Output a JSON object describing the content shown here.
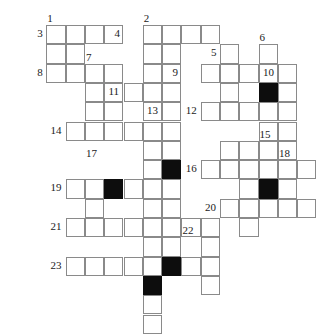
{
  "puzzle": {
    "type": "crossword-grid",
    "title": "Crossword puzzle grid",
    "columns": 15,
    "rows": 14,
    "cell_size": 19.3,
    "origin_x": 27,
    "origin_y": 25,
    "colors": {
      "grid_line": "#8a8a8a",
      "cell_fill": "#ffffff",
      "block_fill": "#0d0d0d",
      "number_text": "#1a1a1a",
      "page_background": "#ffffff"
    },
    "cells": [
      {
        "c": 1,
        "r": 0
      },
      {
        "c": 2,
        "r": 0
      },
      {
        "c": 3,
        "r": 0
      },
      {
        "c": 4,
        "r": 0
      },
      {
        "c": 6,
        "r": 0
      },
      {
        "c": 7,
        "r": 0
      },
      {
        "c": 8,
        "r": 0
      },
      {
        "c": 9,
        "r": 0
      },
      {
        "c": 1,
        "r": 1
      },
      {
        "c": 2,
        "r": 1
      },
      {
        "c": 6,
        "r": 1
      },
      {
        "c": 7,
        "r": 1
      },
      {
        "c": 10,
        "r": 1
      },
      {
        "c": 12,
        "r": 1
      },
      {
        "c": 1,
        "r": 2
      },
      {
        "c": 2,
        "r": 2
      },
      {
        "c": 3,
        "r": 2
      },
      {
        "c": 4,
        "r": 2
      },
      {
        "c": 6,
        "r": 2
      },
      {
        "c": 7,
        "r": 2
      },
      {
        "c": 9,
        "r": 2
      },
      {
        "c": 10,
        "r": 2
      },
      {
        "c": 11,
        "r": 2
      },
      {
        "c": 12,
        "r": 2
      },
      {
        "c": 13,
        "r": 2
      },
      {
        "c": 3,
        "r": 3
      },
      {
        "c": 4,
        "r": 3
      },
      {
        "c": 5,
        "r": 3
      },
      {
        "c": 6,
        "r": 3
      },
      {
        "c": 7,
        "r": 3
      },
      {
        "c": 10,
        "r": 3
      },
      {
        "c": 12,
        "r": 3,
        "black": true
      },
      {
        "c": 13,
        "r": 3
      },
      {
        "c": 3,
        "r": 4
      },
      {
        "c": 4,
        "r": 4
      },
      {
        "c": 6,
        "r": 4
      },
      {
        "c": 7,
        "r": 4
      },
      {
        "c": 9,
        "r": 4
      },
      {
        "c": 10,
        "r": 4
      },
      {
        "c": 11,
        "r": 4
      },
      {
        "c": 12,
        "r": 4
      },
      {
        "c": 13,
        "r": 4
      },
      {
        "c": 2,
        "r": 5
      },
      {
        "c": 3,
        "r": 5
      },
      {
        "c": 4,
        "r": 5
      },
      {
        "c": 5,
        "r": 5
      },
      {
        "c": 6,
        "r": 5
      },
      {
        "c": 7,
        "r": 5
      },
      {
        "c": 12,
        "r": 5
      },
      {
        "c": 13,
        "r": 5
      },
      {
        "c": 6,
        "r": 6
      },
      {
        "c": 7,
        "r": 6
      },
      {
        "c": 10,
        "r": 6
      },
      {
        "c": 11,
        "r": 6
      },
      {
        "c": 12,
        "r": 6
      },
      {
        "c": 13,
        "r": 6
      },
      {
        "c": 6,
        "r": 7
      },
      {
        "c": 7,
        "r": 7,
        "black": true
      },
      {
        "c": 9,
        "r": 7
      },
      {
        "c": 10,
        "r": 7
      },
      {
        "c": 11,
        "r": 7
      },
      {
        "c": 12,
        "r": 7
      },
      {
        "c": 13,
        "r": 7
      },
      {
        "c": 14,
        "r": 7
      },
      {
        "c": 2,
        "r": 8
      },
      {
        "c": 3,
        "r": 8
      },
      {
        "c": 4,
        "r": 8,
        "black": true
      },
      {
        "c": 5,
        "r": 8
      },
      {
        "c": 6,
        "r": 8
      },
      {
        "c": 7,
        "r": 8
      },
      {
        "c": 11,
        "r": 8
      },
      {
        "c": 12,
        "r": 8,
        "black": true
      },
      {
        "c": 13,
        "r": 8
      },
      {
        "c": 3,
        "r": 9
      },
      {
        "c": 6,
        "r": 9
      },
      {
        "c": 7,
        "r": 9
      },
      {
        "c": 10,
        "r": 9
      },
      {
        "c": 11,
        "r": 9
      },
      {
        "c": 12,
        "r": 9
      },
      {
        "c": 13,
        "r": 9
      },
      {
        "c": 14,
        "r": 9
      },
      {
        "c": 2,
        "r": 10
      },
      {
        "c": 3,
        "r": 10
      },
      {
        "c": 4,
        "r": 10
      },
      {
        "c": 5,
        "r": 10
      },
      {
        "c": 6,
        "r": 10
      },
      {
        "c": 7,
        "r": 10
      },
      {
        "c": 8,
        "r": 10
      },
      {
        "c": 9,
        "r": 10
      },
      {
        "c": 11,
        "r": 10
      },
      {
        "c": 6,
        "r": 11
      },
      {
        "c": 7,
        "r": 11
      },
      {
        "c": 9,
        "r": 11
      },
      {
        "c": 2,
        "r": 12
      },
      {
        "c": 3,
        "r": 12
      },
      {
        "c": 4,
        "r": 12
      },
      {
        "c": 5,
        "r": 12
      },
      {
        "c": 6,
        "r": 12
      },
      {
        "c": 7,
        "r": 12,
        "black": true
      },
      {
        "c": 8,
        "r": 12
      },
      {
        "c": 9,
        "r": 12
      },
      {
        "c": 6,
        "r": 13,
        "black": true
      },
      {
        "c": 9,
        "r": 13
      },
      {
        "c": 6,
        "r": 14
      },
      {
        "c": 6,
        "r": 15
      }
    ],
    "numbers": [
      {
        "label": "1",
        "c": 1,
        "r": 0,
        "anchor": "above-left"
      },
      {
        "label": "2",
        "c": 6,
        "r": 0,
        "anchor": "above-left"
      },
      {
        "label": "3",
        "c": 1,
        "r": 0,
        "anchor": "left"
      },
      {
        "label": "4",
        "c": 5,
        "r": 0,
        "anchor": "left"
      },
      {
        "label": "5",
        "c": 10,
        "r": 1,
        "anchor": "left"
      },
      {
        "label": "6",
        "c": 12,
        "r": 1,
        "anchor": "above-left"
      },
      {
        "label": "7",
        "c": 3,
        "r": 2,
        "anchor": "above-left"
      },
      {
        "label": "8",
        "c": 1,
        "r": 2,
        "anchor": "left"
      },
      {
        "label": "9",
        "c": 8,
        "r": 2,
        "anchor": "left"
      },
      {
        "label": "10",
        "c": 13,
        "r": 2,
        "anchor": "left"
      },
      {
        "label": "11",
        "c": 5,
        "r": 3,
        "anchor": "left"
      },
      {
        "label": "12",
        "c": 9,
        "r": 4,
        "anchor": "left"
      },
      {
        "label": "13",
        "c": 7,
        "r": 4,
        "anchor": "left"
      },
      {
        "label": "14",
        "c": 2,
        "r": 5,
        "anchor": "left"
      },
      {
        "label": "15",
        "c": 12,
        "r": 6,
        "anchor": "above-left"
      },
      {
        "label": "16",
        "c": 9,
        "r": 7,
        "anchor": "left"
      },
      {
        "label": "17",
        "c": 3,
        "r": 7,
        "anchor": "above-left"
      },
      {
        "label": "18",
        "c": 13,
        "r": 7,
        "anchor": "above-left"
      },
      {
        "label": "19",
        "c": 2,
        "r": 8,
        "anchor": "left"
      },
      {
        "label": "20",
        "c": 10,
        "r": 9,
        "anchor": "left"
      },
      {
        "label": "21",
        "c": 2,
        "r": 10,
        "anchor": "left"
      },
      {
        "label": "22",
        "c": 8,
        "r": 11,
        "anchor": "above-left"
      },
      {
        "label": "23",
        "c": 2,
        "r": 12,
        "anchor": "left"
      }
    ]
  }
}
